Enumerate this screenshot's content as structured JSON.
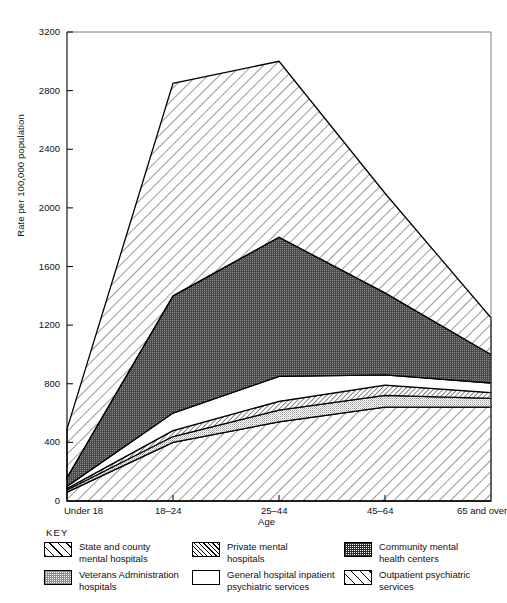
{
  "chart_data": {
    "type": "area",
    "title": "",
    "xlabel": "Age",
    "ylabel": "Rate per 100,000 population",
    "categories": [
      "Under 18",
      "18–24",
      "25–44",
      "45–64",
      "65 and over"
    ],
    "ylim": [
      0,
      3200
    ],
    "yticks": [
      0,
      400,
      800,
      1200,
      1600,
      2000,
      2400,
      2800,
      3200
    ],
    "grid": false,
    "stacked": true,
    "legend_position": "below-plot",
    "legend_title": "KEY",
    "series": [
      {
        "name": "Outpatient psychiatric services",
        "pattern": "wide-diagonal-hatch",
        "values": [
          60,
          400,
          540,
          640,
          640
        ],
        "cumulative_top": [
          60,
          400,
          540,
          640,
          640
        ]
      },
      {
        "name": "Veterans Administration hospitals",
        "pattern": "light-stipple",
        "values": [
          15,
          40,
          80,
          80,
          60
        ],
        "cumulative_top": [
          75,
          440,
          620,
          720,
          700
        ]
      },
      {
        "name": "Private mental hospitals",
        "pattern": "dense-diagonal-hatch",
        "values": [
          10,
          40,
          60,
          70,
          40
        ],
        "cumulative_top": [
          85,
          480,
          680,
          790,
          740
        ]
      },
      {
        "name": "General hospital inpatient psychiatric services",
        "pattern": "blank-white",
        "values": [
          15,
          120,
          170,
          70,
          65
        ],
        "cumulative_top": [
          100,
          600,
          850,
          860,
          805
        ]
      },
      {
        "name": "Community mental health centers",
        "pattern": "dark-stipple",
        "values": [
          60,
          800,
          950,
          560,
          195
        ],
        "cumulative_top": [
          160,
          1400,
          1800,
          1420,
          1000
        ]
      },
      {
        "name": "State and county mental hospitals",
        "pattern": "wide-diagonal-hatch",
        "values": [
          330,
          1450,
          1200,
          680,
          250
        ],
        "cumulative_top": [
          490,
          2850,
          3000,
          2100,
          1250
        ]
      }
    ]
  },
  "axis": {
    "y_label": "Rate per 100,000 population",
    "x_label": "Age",
    "y_ticks": [
      "0",
      "400",
      "800",
      "1200",
      "1600",
      "2000",
      "2400",
      "2800",
      "3200"
    ],
    "x_ticks": [
      "Under 18",
      "18–24",
      "25–44",
      "45–64",
      "65 and over"
    ]
  },
  "legend": {
    "title": "KEY",
    "columns": [
      [
        {
          "label": "State and county\nmental hospitals",
          "swatch": "sw-state",
          "icon": "wide-hatch-swatch"
        },
        {
          "label": "Veterans Administration\nhospitals",
          "swatch": "sw-va",
          "icon": "light-stipple-swatch"
        }
      ],
      [
        {
          "label": "Private mental\nhospitals",
          "swatch": "sw-private",
          "icon": "dense-hatch-swatch"
        },
        {
          "label": "General hospital inpatient\npsychiatric services",
          "swatch": "sw-general",
          "icon": "blank-swatch"
        }
      ],
      [
        {
          "label": "Community mental\nhealth centers",
          "swatch": "sw-community",
          "icon": "dark-stipple-swatch"
        },
        {
          "label": "Outpatient psychiatric\nservices",
          "swatch": "sw-outpatient",
          "icon": "wide-hatch-swatch"
        }
      ]
    ],
    "items_flat": [
      "State and county mental hospitals",
      "Veterans Administration hospitals",
      "Private mental hospitals",
      "General hospital inpatient psychiatric services",
      "Community mental health centers",
      "Outpatient psychiatric services"
    ]
  }
}
